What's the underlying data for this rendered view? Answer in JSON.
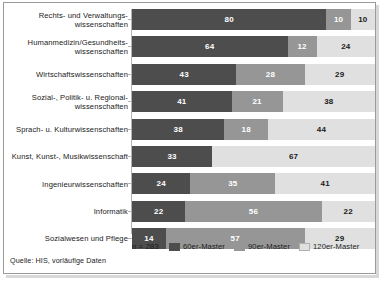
{
  "chart_data": {
    "type": "bar",
    "orientation": "horizontal",
    "stacked": true,
    "percent": true,
    "title": "",
    "subtitle": "",
    "xlabel": "",
    "ylabel": "",
    "xlim": [
      0,
      100
    ],
    "grid": false,
    "legend_position": "bottom",
    "categories": [
      "Rechts- und Verwaltungs-\nwissenschaften",
      "Humanmedizin/Gesundheits-\nwissenschaften",
      "Wirtschaftswissenschaften",
      "Sozial-, Politik- u. Regional-\nwissenschaften",
      "Sprach- u. Kulturwissenschaften",
      "Kunst, Kunst-, Musikwissenschaft",
      "Ingenieurwissenschaften",
      "Informatik",
      "Sozialwesen und Pflege"
    ],
    "series": [
      {
        "name": "60er-Master",
        "color": "#4d4d4d",
        "values": [
          80,
          64,
          43,
          41,
          38,
          33,
          24,
          22,
          14
        ]
      },
      {
        "name": "90er-Master",
        "color": "#969696",
        "values": [
          10,
          12,
          28,
          21,
          18,
          0,
          35,
          56,
          57
        ]
      },
      {
        "name": "120er-Master",
        "color": "#e0e0e0",
        "values": [
          10,
          24,
          29,
          38,
          44,
          67,
          41,
          22,
          29
        ]
      }
    ],
    "annotations": {
      "n_label": "n = 283",
      "source": "Quelle: HIS, vorläufige Daten"
    }
  },
  "legend": {
    "n_label": "n = 283",
    "items": [
      {
        "label": "60er-Master",
        "swatch": "swatch-dark"
      },
      {
        "label": "90er-Master",
        "swatch": "swatch-medium"
      },
      {
        "label": "120er-Master",
        "swatch": "swatch-light"
      }
    ]
  },
  "footer": {
    "source": "Quelle: HIS, vorläufige Daten"
  }
}
